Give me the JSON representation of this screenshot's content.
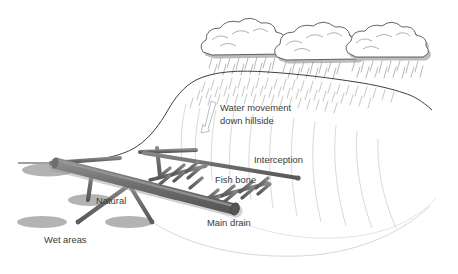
{
  "diagram": {
    "background_color": "#ffffff",
    "labels": {
      "water_movement_line1": "Water movement",
      "water_movement_line2": "down hillside",
      "interception": "Interception",
      "fish_bone": "Fish bone",
      "natural": "Natural",
      "main_drain": "Main drain",
      "wet_areas": "Wet areas"
    },
    "icons": {
      "flow_arrow": "down-arrow-icon",
      "rain": "rain-hatching-icon",
      "cloud": "cloud-icon"
    },
    "colors": {
      "pipe": "#6e6e6e",
      "pipe_dark": "#5a5a5a",
      "pipe_light": "#8a8a8a",
      "wet_area": "#b3b3b3",
      "cloud_outline": "#4a4a4a",
      "cloud_shadow": "#b8b8b8",
      "ridge_line": "#3f3f3f",
      "contour": "#cfcfcf",
      "rain": "#8f8f8f",
      "text": "#3a3a3a"
    },
    "elements": {
      "clouds_count": 3,
      "wet_areas_count": 4,
      "fishbone_groups": 2
    }
  }
}
